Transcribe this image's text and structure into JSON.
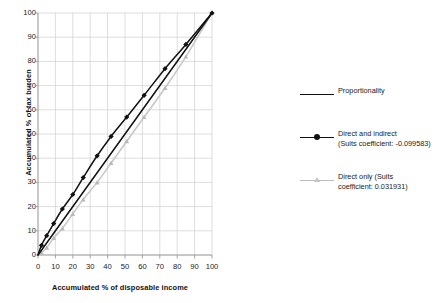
{
  "chart_data": {
    "type": "line",
    "title": "",
    "xlabel": "Accumulated % of disposable income",
    "ylabel": "Accumulated % of tax burden",
    "xlim": [
      0,
      100
    ],
    "ylim": [
      0,
      100
    ],
    "xticks": [
      0,
      10,
      20,
      30,
      40,
      50,
      60,
      70,
      80,
      90,
      100
    ],
    "yticks": [
      0,
      10,
      20,
      30,
      40,
      50,
      60,
      70,
      80,
      90,
      100
    ],
    "grid": true,
    "legend_position": "right",
    "series": [
      {
        "name": "Proportionality",
        "label_line1": "Proportionality",
        "label_line2": "",
        "color": "#111111",
        "marker": "none",
        "x": [
          0,
          100
        ],
        "y": [
          0,
          100
        ]
      },
      {
        "name": "Direct and indirect",
        "label_line1": "Direct and indirect",
        "label_line2": "(Suits coefficient: -0.099583)",
        "suits_coefficient": -0.099583,
        "color": "#111111",
        "marker": "diamond",
        "x": [
          0,
          2,
          5,
          9,
          14,
          20,
          26,
          34,
          42,
          51,
          61,
          73,
          85,
          100
        ],
        "y": [
          0,
          4,
          8,
          13,
          19,
          25,
          32,
          41,
          49,
          57,
          66,
          77,
          87,
          100
        ]
      },
      {
        "name": "Direct only",
        "label_line1": "Direct only (Suits",
        "label_line2": "coefficient: 0.031931)",
        "suits_coefficient": 0.031931,
        "color": "#c6c6c6",
        "marker": "triangle",
        "x": [
          0,
          2,
          5,
          9,
          14,
          20,
          26,
          34,
          42,
          51,
          61,
          73,
          85,
          100
        ],
        "y": [
          0,
          1,
          3,
          7,
          11,
          17,
          23,
          30,
          38,
          47,
          57,
          69,
          82,
          100
        ]
      }
    ]
  },
  "legend": {
    "entries": [
      {
        "line1": "Proportionality",
        "line2": ""
      },
      {
        "line1": "Direct and indirect",
        "line2": "(Suits coefficient: -0.099583)"
      },
      {
        "line1": "Direct only (Suits",
        "line2": "coefficient: 0.031931)"
      }
    ]
  },
  "axes": {
    "x_title": "Accumulated % of disposable income",
    "y_title": "Accumulated % of tax burden"
  }
}
